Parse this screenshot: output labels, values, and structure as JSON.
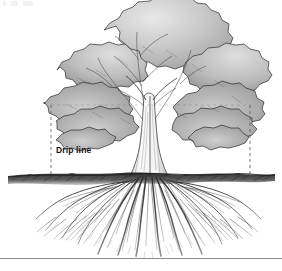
{
  "figure": {
    "alt": "Cross-section illustration of a broadleaf tree showing canopy, trunk, soil line and fibrous root system, with dashed drip line markers",
    "width": 282,
    "height": 271,
    "background_color": "#ffffff"
  },
  "annotations": {
    "drip_line_label": "Drip line",
    "drip_line_label_color": "#111111"
  },
  "parts": {
    "canopy_name": "tree-canopy",
    "trunk_name": "tree-trunk",
    "ground_name": "ground-line",
    "roots_name": "root-system",
    "left_marker_name": "drip-line-left",
    "right_marker_name": "drip-line-right",
    "top_marker_name": "drip-line-top"
  },
  "geometry": {
    "canopy_left_x": 40,
    "canopy_right_x": 266,
    "canopy_top_y": 2,
    "canopy_bottom_y": 142,
    "drip_left_x": 51,
    "drip_right_x": 250,
    "drip_top_y": 105,
    "ground_y": 176,
    "trunk_left_x": 138,
    "trunk_right_x": 158,
    "root_depth_y": 256,
    "rule_y": 258
  },
  "colors": {
    "leaf_fill_light": "#d8d8d8",
    "leaf_fill_mid": "#b8b8b8",
    "leaf_fill_dark": "#9a9a9a",
    "outline": "#2b2b2b",
    "soil": "#1f1f1f",
    "root": "#333333",
    "dashed_marker": "#555555",
    "rule": "#8d8d8d"
  }
}
